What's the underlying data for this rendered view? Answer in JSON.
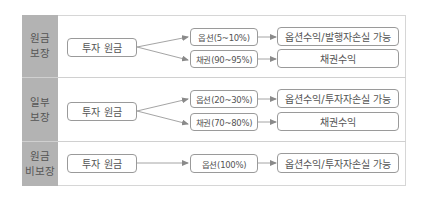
{
  "colors": {
    "label_bg": "#b3b3b3",
    "border": "#9a9a9a",
    "arrow": "#8a8a8a",
    "frame": "#d6d6d6"
  },
  "rows": [
    {
      "label": [
        "원금",
        "보장"
      ],
      "source": "투자 원금",
      "branches": [
        {
          "allocation": "옵션(5~10%)",
          "result": "옵션수익/발행자손실 가능"
        },
        {
          "allocation": "채권(90~95%)",
          "result": "채권수익"
        }
      ]
    },
    {
      "label": [
        "일부",
        "보장"
      ],
      "source": "투자 원금",
      "branches": [
        {
          "allocation": "옵션(20~30%)",
          "result": "옵션수익/투자자손실 가능"
        },
        {
          "allocation": "채권(70~80%)",
          "result": "채권수익"
        }
      ]
    },
    {
      "label": [
        "원금",
        "비보장"
      ],
      "source": "투자 원금",
      "branches": [
        {
          "allocation": "옵션(100%)",
          "result": "옵션수익/투자자손실 가능"
        }
      ]
    }
  ]
}
